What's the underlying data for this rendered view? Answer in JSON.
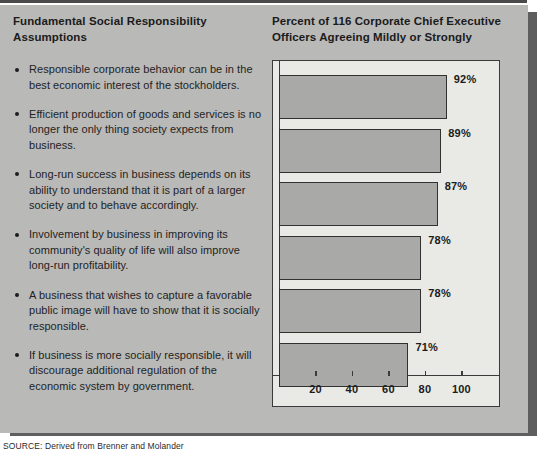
{
  "left_panel": {
    "heading": "Fundamental Social Responsibility Assumptions",
    "bullets": [
      "Responsible corporate behavior can be in the best economic interest of the stockholders.",
      "Efficient production of goods and services is no longer the only thing society expects from business.",
      "Long-run success in business depends on its ability to understand that it is part of a larger society and to behave accordingly.",
      "Involvement by business in improving its community's quality of life will also improve long-run profitability.",
      "A business that wishes to capture a favorable public image will have to show that it is socially responsible.",
      "If business is more socially responsible, it will discourage additional regulation of the economic system by government."
    ]
  },
  "source": {
    "text": "SOURCE: Derived from Brenner and Molander"
  },
  "colors": {
    "panel_background": "#b9b9b7",
    "plot_background": "#e9e9e6",
    "bar_fill": "#a9a9a7",
    "bar_border": "#313131",
    "text": "#1b1b1b",
    "shadow": "#5e5e5e"
  },
  "chart_data": {
    "type": "bar",
    "orientation": "horizontal",
    "title": "Percent of 116 Corporate Chief Executive Officers Agreeing Mildly or Strongly",
    "xlabel": "",
    "ylabel": "",
    "xlim": [
      0,
      118
    ],
    "grid": false,
    "legend": null,
    "xticks": [
      20,
      40,
      60,
      80,
      100
    ],
    "xtick_labels": [
      "20",
      "40",
      "60",
      "80",
      "100"
    ],
    "categories": [
      "Responsible corporate behavior can be in the best economic interest of the stockholders.",
      "Efficient production of goods and services is no longer the only thing society expects from business.",
      "Long-run success in business depends on its ability to understand that it is part of a larger society and to behave accordingly.",
      "Involvement by business in improving its community's quality of life will also improve long-run profitability.",
      "A business that wishes to capture a favorable public image will have to show that it is socially responsible.",
      "If business is more socially responsible, it will discourage additional regulation of the economic system by government."
    ],
    "values": [
      92,
      89,
      87,
      78,
      78,
      71
    ],
    "data_labels": [
      "92%",
      "89%",
      "87%",
      "78%",
      "78%",
      "71%"
    ]
  }
}
